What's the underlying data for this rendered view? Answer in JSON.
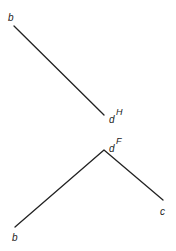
{
  "diagram": {
    "colors": {
      "line": "#222222",
      "background": "#ffffff"
    },
    "top_figure": {
      "segment": {
        "x1": 14,
        "y1": 26,
        "x2": 104,
        "y2": 115
      },
      "labels": [
        {
          "id": "top-b",
          "text": "b",
          "x": 8,
          "y": 21,
          "size": 10
        },
        {
          "id": "top-d",
          "text": "d",
          "x": 109,
          "y": 123,
          "size": 10
        },
        {
          "id": "top-H",
          "text": "H",
          "x": 116,
          "y": 115,
          "size": 9
        }
      ]
    },
    "bottom_figure": {
      "polyline": [
        [
          15,
          227
        ],
        [
          104,
          150
        ],
        [
          163,
          200
        ]
      ],
      "labels": [
        {
          "id": "bottom-d",
          "text": "d",
          "x": 109,
          "y": 152,
          "size": 10
        },
        {
          "id": "bottom-F",
          "text": "F",
          "x": 116,
          "y": 144,
          "size": 9
        },
        {
          "id": "bottom-c",
          "text": "c",
          "x": 160,
          "y": 215,
          "size": 10
        },
        {
          "id": "bottom-b",
          "text": "b",
          "x": 12,
          "y": 241,
          "size": 10
        }
      ]
    }
  }
}
